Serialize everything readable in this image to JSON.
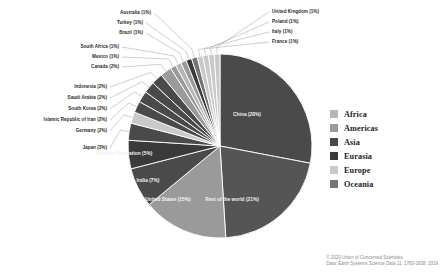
{
  "chart_data": {
    "type": "pie",
    "title": "",
    "subtitle": "",
    "units": "percent",
    "total_label": "100%",
    "legend_position": "right",
    "grid": false,
    "center": {
      "x": 220,
      "y": 146
    },
    "radius": 92,
    "start_angle_deg": -90,
    "direction": "clockwise",
    "categories": [
      "China (28%)",
      "Rest of the world (21%)",
      "United States (15%)",
      "India (7%)",
      "Russian Federation (5%)",
      "Japan (3%)",
      "Germany (2%)",
      "Islamic Republic of Iran (2%)",
      "South Korea (2%)",
      "Saudi Arabia (2%)",
      "Indonesia (2%)",
      "Canada (2%)",
      "Mexico (1%)",
      "South Africa (1%)",
      "Brazil (1%)",
      "Turkey (1%)",
      "Australia (1%)",
      "France (1%)",
      "Italy (1%)",
      "Poland (1%)",
      "United Kingdom (1%)"
    ],
    "values": [
      28,
      21,
      15,
      7,
      5,
      3,
      2,
      2,
      2,
      2,
      2,
      2,
      1,
      1,
      1,
      1,
      1,
      1,
      1,
      1,
      1
    ],
    "slices": [
      {
        "name": "China",
        "label": "China (28%)",
        "value": 28,
        "region": "Asia",
        "color": "#4a4a4a",
        "label_placement": "inside"
      },
      {
        "name": "Rest of the world",
        "label": "Rest of the world (21%)",
        "value": 21,
        "region": "Rest of the world",
        "color": "#555555",
        "label_placement": "inside"
      },
      {
        "name": "United States",
        "label": "United States (15%)",
        "value": 15,
        "region": "Americas",
        "color": "#9a9a9a",
        "label_placement": "inside"
      },
      {
        "name": "India",
        "label": "India (7%)",
        "value": 7,
        "region": "Asia",
        "color": "#4a4a4a",
        "label_placement": "inside"
      },
      {
        "name": "Russian Federation",
        "label": "Russian Federation (5%)",
        "value": 5,
        "region": "Eurasia",
        "color": "#3a3a3a",
        "label_placement": "inside"
      },
      {
        "name": "Japan",
        "label": "Japan (3%)",
        "value": 3,
        "region": "Asia",
        "color": "#4a4a4a",
        "label_placement": "callout"
      },
      {
        "name": "Germany",
        "label": "Germany (2%)",
        "value": 2,
        "region": "Europe",
        "color": "#c9c9c9",
        "label_placement": "callout"
      },
      {
        "name": "Islamic Republic of Iran",
        "label": "Islamic Republic of Iran (2%)",
        "value": 2,
        "region": "Asia",
        "color": "#4a4a4a",
        "label_placement": "callout"
      },
      {
        "name": "South Korea",
        "label": "South Korea (2%)",
        "value": 2,
        "region": "Asia",
        "color": "#4a4a4a",
        "label_placement": "callout"
      },
      {
        "name": "Saudi Arabia",
        "label": "Saudi Arabia (2%)",
        "value": 2,
        "region": "Asia",
        "color": "#4a4a4a",
        "label_placement": "callout"
      },
      {
        "name": "Indonesia",
        "label": "Indonesia (2%)",
        "value": 2,
        "region": "Asia",
        "color": "#4a4a4a",
        "label_placement": "callout"
      },
      {
        "name": "Canada",
        "label": "Canada (2%)",
        "value": 2,
        "region": "Americas",
        "color": "#9a9a9a",
        "label_placement": "callout"
      },
      {
        "name": "Mexico",
        "label": "Mexico (1%)",
        "value": 1,
        "region": "Americas",
        "color": "#9a9a9a",
        "label_placement": "callout"
      },
      {
        "name": "South Africa",
        "label": "South Africa (1%)",
        "value": 1,
        "region": "Africa",
        "color": "#b6b6b6",
        "label_placement": "callout"
      },
      {
        "name": "Brazil",
        "label": "Brazil (1%)",
        "value": 1,
        "region": "Americas",
        "color": "#9a9a9a",
        "label_placement": "callout"
      },
      {
        "name": "Turkey",
        "label": "Turkey (1%)",
        "value": 1,
        "region": "Eurasia",
        "color": "#3a3a3a",
        "label_placement": "callout"
      },
      {
        "name": "Australia",
        "label": "Australia (1%)",
        "value": 1,
        "region": "Oceania",
        "color": "#747474",
        "label_placement": "callout"
      },
      {
        "name": "France",
        "label": "France (1%)",
        "value": 1,
        "region": "Europe",
        "color": "#c9c9c9",
        "label_placement": "callout"
      },
      {
        "name": "Italy",
        "label": "Italy (1%)",
        "value": 1,
        "region": "Europe",
        "color": "#c9c9c9",
        "label_placement": "callout"
      },
      {
        "name": "Poland",
        "label": "Poland (1%)",
        "value": 1,
        "region": "Europe",
        "color": "#c9c9c9",
        "label_placement": "callout"
      },
      {
        "name": "United Kingdom",
        "label": "United Kingdom (1%)",
        "value": 1,
        "region": "Europe",
        "color": "#c9c9c9",
        "label_placement": "callout"
      }
    ],
    "legend": {
      "entries": [
        {
          "label": "Africa",
          "color": "#b6b6b6"
        },
        {
          "label": "Americas",
          "color": "#9a9a9a"
        },
        {
          "label": "Asia",
          "color": "#4a4a4a"
        },
        {
          "label": "Eurasia",
          "color": "#3a3a3a"
        },
        {
          "label": "Europe",
          "color": "#c9c9c9"
        },
        {
          "label": "Oceania",
          "color": "#747474"
        }
      ]
    }
  },
  "attribution": {
    "line1": "© 2020 Union of Concerned Scientists",
    "line2": "Data: Earth Systems Science Data 11, 1783-1838, 2019"
  },
  "colors": {
    "background": "#ffffff",
    "label_text": "#2b2b2b",
    "legend_text": "#1d1d1d",
    "attribution_text": "#8a8a8a",
    "leader_line": "#9e9e9e",
    "inside_label_light": "#f2f2f2"
  }
}
